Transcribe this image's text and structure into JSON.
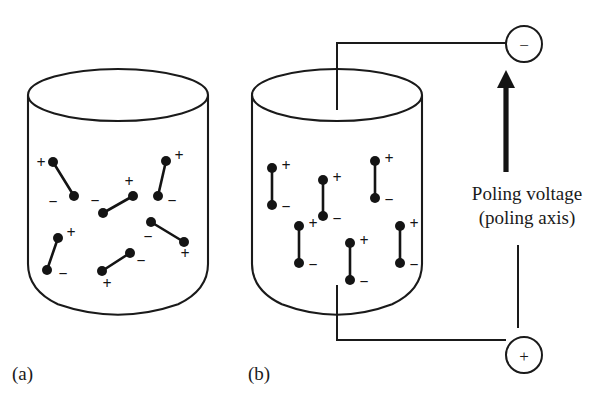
{
  "figure": {
    "background_color": "#ffffff",
    "ink_color": "#1a1a1a",
    "panels": [
      {
        "id": "a",
        "label": "(a)",
        "label_x": 12,
        "label_y": 380,
        "description": "unpoled ceramic with randomly oriented dipoles"
      },
      {
        "id": "b",
        "label": "(b)",
        "label_x": 248,
        "label_y": 380,
        "description": "poled ceramic with dipoles aligned to poling axis"
      }
    ]
  },
  "annotations": {
    "poling_voltage_line1": "Poling voltage",
    "poling_voltage_line2": "(poling axis)",
    "poling_text_x": 527,
    "poling_text_y1": 200,
    "poling_text_y2": 224
  },
  "electrodes": [
    {
      "name": "negative-electrode",
      "sign": "−",
      "cx": 524,
      "cy": 44,
      "r": 18
    },
    {
      "name": "positive-electrode",
      "sign": "+",
      "cx": 524,
      "cy": 355,
      "r": 18
    }
  ],
  "cylinder_a": {
    "cx": 118,
    "top_y": 95,
    "bottom_y": 290,
    "rx": 90,
    "ry": 26,
    "corner_r": 26,
    "left_x": 28,
    "right_x": 208
  },
  "cylinder_b": {
    "cx": 337,
    "top_y": 95,
    "bottom_y": 290,
    "rx": 85,
    "ry": 26,
    "corner_r": 26,
    "left_x": 252,
    "right_x": 422
  },
  "wiring": {
    "top_wire_points": "337,110 337,43 506,43",
    "bottom_wire_points": "337,285 337,340 506,340",
    "arrow_x": 506,
    "arrow_tail_y": 172,
    "arrow_head_y": 70,
    "arrow_head_half_width": 9,
    "arrow_head_length": 18,
    "thin_axis_x": 518,
    "thin_axis_y1": 245,
    "thin_axis_y2": 328
  },
  "dipoles_random": [
    {
      "x1": 53,
      "y1": 162,
      "x2": 74,
      "y2": 196,
      "plus_x": 41,
      "plus_y": 164,
      "minus_x": 53,
      "minus_y": 203
    },
    {
      "x1": 58,
      "y1": 238,
      "x2": 47,
      "y2": 270,
      "plus_x": 71,
      "plus_y": 234,
      "minus_x": 63,
      "minus_y": 275
    },
    {
      "x1": 103,
      "y1": 213,
      "x2": 133,
      "y2": 196,
      "plus_x": 129,
      "plus_y": 183,
      "minus_x": 95,
      "minus_y": 202
    },
    {
      "x1": 102,
      "y1": 271,
      "x2": 130,
      "y2": 253,
      "plus_x": 107,
      "plus_y": 285,
      "minus_x": 141,
      "minus_y": 262
    },
    {
      "x1": 166,
      "y1": 161,
      "x2": 158,
      "y2": 196,
      "plus_x": 179,
      "plus_y": 157,
      "minus_x": 172,
      "minus_y": 202
    },
    {
      "x1": 151,
      "y1": 222,
      "x2": 184,
      "y2": 242,
      "plus_x": 185,
      "plus_y": 255,
      "minus_x": 148,
      "minus_y": 238
    }
  ],
  "dipoles_aligned": [
    {
      "x": 272,
      "y_top": 168,
      "y_bot": 205,
      "plus_x": 286,
      "plus_y": 167,
      "minus_x": 286,
      "minus_y": 208
    },
    {
      "x": 323,
      "y_top": 180,
      "y_bot": 216,
      "plus_x": 337,
      "plus_y": 179,
      "minus_x": 337,
      "minus_y": 220
    },
    {
      "x": 375,
      "y_top": 161,
      "y_bot": 198,
      "plus_x": 389,
      "plus_y": 160,
      "minus_x": 389,
      "minus_y": 201
    },
    {
      "x": 299,
      "y_top": 226,
      "y_bot": 263,
      "plus_x": 313,
      "plus_y": 225,
      "minus_x": 313,
      "minus_y": 266
    },
    {
      "x": 350,
      "y_top": 243,
      "y_bot": 280,
      "plus_x": 364,
      "plus_y": 242,
      "minus_x": 364,
      "minus_y": 283
    },
    {
      "x": 400,
      "y_top": 226,
      "y_bot": 263,
      "plus_x": 414,
      "plus_y": 225,
      "minus_x": 414,
      "minus_y": 266
    }
  ],
  "signs": {
    "plus": "+",
    "minus": "−"
  }
}
